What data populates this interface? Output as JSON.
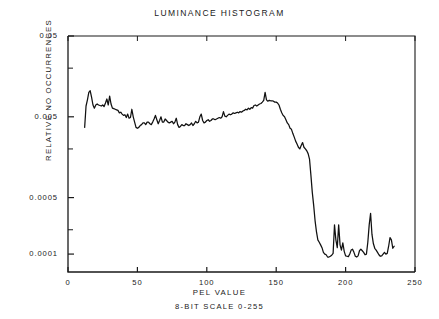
{
  "chart_data": {
    "type": "line",
    "title": "LUMINANCE HISTOGRAM",
    "xlabel": "PEL VALUE",
    "xlabel_sub": "8-BIT SCALE 0-255",
    "ylabel": "RELATIVE NO  OCCURRENCES",
    "yscale": "log",
    "xscale": "linear",
    "xlim": [
      0,
      250
    ],
    "ylim": [
      6e-05,
      0.05
    ],
    "grid": false,
    "legend": null,
    "line_color": "#111111",
    "axis_color": "#1a1a1a",
    "background": "#ffffff",
    "xticks": [
      0,
      50,
      100,
      150,
      200,
      250
    ],
    "xtick_labels": [
      "0",
      "50",
      "100",
      "150",
      "200",
      "250"
    ],
    "yticks": [
      0.05,
      0.005,
      0.0005,
      0.0001
    ],
    "ytick_labels": [
      "0.05",
      "0.005",
      "0.0005",
      "0.0001"
    ],
    "yminor_ticks": [
      0.02,
      0.002,
      0.0002
    ],
    "x": [
      12,
      13,
      14,
      15,
      16,
      17,
      18,
      19,
      20,
      21,
      22,
      23,
      24,
      25,
      26,
      27,
      28,
      29,
      30,
      31,
      32,
      33,
      34,
      35,
      36,
      37,
      38,
      39,
      40,
      41,
      42,
      43,
      44,
      45,
      46,
      47,
      48,
      49,
      50,
      51,
      52,
      53,
      54,
      55,
      56,
      57,
      58,
      59,
      60,
      61,
      62,
      63,
      64,
      65,
      66,
      67,
      68,
      69,
      70,
      71,
      72,
      73,
      74,
      75,
      76,
      77,
      78,
      79,
      80,
      81,
      82,
      83,
      84,
      85,
      86,
      87,
      88,
      89,
      90,
      91,
      92,
      93,
      94,
      95,
      96,
      97,
      98,
      99,
      100,
      101,
      102,
      103,
      104,
      105,
      106,
      107,
      108,
      109,
      110,
      111,
      112,
      113,
      114,
      115,
      116,
      117,
      118,
      119,
      120,
      121,
      122,
      123,
      124,
      125,
      126,
      127,
      128,
      129,
      130,
      131,
      132,
      133,
      134,
      135,
      136,
      137,
      138,
      139,
      140,
      141,
      142,
      143,
      144,
      145,
      146,
      147,
      148,
      149,
      150,
      151,
      152,
      153,
      154,
      155,
      156,
      157,
      158,
      159,
      160,
      161,
      162,
      163,
      164,
      165,
      166,
      167,
      168,
      169,
      170,
      171,
      172,
      173,
      174,
      175,
      176,
      177,
      178,
      179,
      180,
      181,
      182,
      183,
      184,
      185,
      186,
      187,
      188,
      189,
      190,
      191,
      192,
      193,
      194,
      195,
      196,
      197,
      198,
      199,
      200,
      201,
      202,
      203,
      204,
      205,
      206,
      207,
      208,
      209,
      210,
      211,
      212,
      213,
      214,
      215,
      216,
      217,
      218,
      219,
      220,
      221,
      222,
      223,
      224,
      225,
      226,
      227,
      228,
      229,
      230,
      231,
      232,
      233,
      234,
      235,
      236,
      237,
      238,
      239,
      240,
      241,
      242,
      243,
      244,
      245
    ],
    "y": [
      0.0037,
      0.0068,
      0.0081,
      0.01,
      0.0105,
      0.0087,
      0.007,
      0.0064,
      0.007,
      0.0072,
      0.007,
      0.0069,
      0.0068,
      0.007,
      0.0067,
      0.0074,
      0.0083,
      0.007,
      0.009,
      0.0072,
      0.0064,
      0.0063,
      0.0062,
      0.0061,
      0.006,
      0.0056,
      0.0057,
      0.0054,
      0.0052,
      0.0053,
      0.0049,
      0.0054,
      0.0048,
      0.0049,
      0.0062,
      0.005,
      0.0043,
      0.0037,
      0.0036,
      0.0037,
      0.0039,
      0.004,
      0.0042,
      0.0042,
      0.004,
      0.0043,
      0.0043,
      0.0041,
      0.004,
      0.0043,
      0.0047,
      0.0052,
      0.0046,
      0.0041,
      0.0045,
      0.005,
      0.0043,
      0.0043,
      0.0047,
      0.0045,
      0.0043,
      0.0042,
      0.0043,
      0.0044,
      0.0041,
      0.0043,
      0.0048,
      0.004,
      0.0037,
      0.0038,
      0.004,
      0.0039,
      0.0039,
      0.0041,
      0.004,
      0.0039,
      0.004,
      0.0042,
      0.0039,
      0.0041,
      0.0044,
      0.0042,
      0.0043,
      0.005,
      0.0054,
      0.0045,
      0.0042,
      0.0043,
      0.0045,
      0.0046,
      0.0044,
      0.0045,
      0.0047,
      0.0047,
      0.0046,
      0.0047,
      0.0048,
      0.0049,
      0.0048,
      0.005,
      0.0058,
      0.0051,
      0.005,
      0.0052,
      0.0054,
      0.0053,
      0.0054,
      0.0056,
      0.0055,
      0.0056,
      0.0057,
      0.0056,
      0.0058,
      0.0057,
      0.0059,
      0.006,
      0.0062,
      0.0061,
      0.0064,
      0.0062,
      0.0065,
      0.0064,
      0.0069,
      0.007,
      0.0068,
      0.007,
      0.0072,
      0.0073,
      0.0076,
      0.008,
      0.01,
      0.0081,
      0.0078,
      0.008,
      0.0079,
      0.0079,
      0.0078,
      0.0076,
      0.0076,
      0.0074,
      0.007,
      0.0062,
      0.0056,
      0.0052,
      0.005,
      0.0046,
      0.0042,
      0.004,
      0.0036,
      0.0035,
      0.0031,
      0.0028,
      0.0025,
      0.0023,
      0.0021,
      0.002,
      0.0022,
      0.0024,
      0.0021,
      0.002,
      0.0019,
      0.00175,
      0.0015,
      0.00095,
      0.00058,
      0.0004,
      0.00026,
      0.00019,
      0.00015,
      0.00014,
      0.00013,
      0.00012,
      0.000105,
      0.0001,
      9.8e-05,
      9.2e-05,
      9.2e-05,
      9.4e-05,
      9.7e-05,
      0.000102,
      0.00023,
      0.00015,
      0.00012,
      0.00023,
      0.00013,
      0.000112,
      0.000138,
      0.000108,
      9.5e-05,
      9.4e-05,
      9.3e-05,
      0.0001,
      0.000112,
      0.000115,
      0.000105,
      9.4e-05,
      9.2e-05,
      9.5e-05,
      0.00011,
      0.000115,
      0.00011,
      0.000105,
      9.8e-05,
      0.0001,
      0.00014,
      0.00023,
      0.00032,
      0.000175,
      0.000135,
      0.000118,
      0.000112,
      0.000105,
      9.8e-05,
      9.4e-05,
      9.5e-05,
      0.0001,
      0.000105,
      0.0001,
      0.000102,
      0.000125,
      0.00016,
      0.00015,
      0.000118,
      0.000125
    ]
  }
}
